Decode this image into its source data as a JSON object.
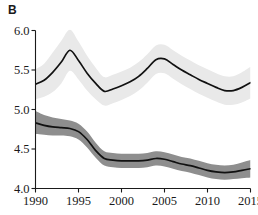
{
  "panel": {
    "label": "B"
  },
  "chart_data": {
    "type": "line",
    "title": "",
    "subtitle": "",
    "xlabel": "",
    "ylabel": "",
    "xlim": [
      1990,
      2015
    ],
    "ylim": [
      4.0,
      6.0
    ],
    "grid": false,
    "legend": null,
    "xticks": [
      "1990",
      "1995",
      "2000",
      "2005",
      "2010",
      "2015"
    ],
    "xtick_values": [
      1990,
      1995,
      2000,
      2005,
      2010,
      2015
    ],
    "yticks": [
      "4.0",
      "4.5",
      "5.0",
      "5.5",
      "6.0"
    ],
    "ytick_values": [
      4.0,
      4.5,
      5.0,
      5.5,
      6.0
    ],
    "x": [
      1990,
      1991,
      1992,
      1993,
      1994,
      1995,
      1996,
      1997,
      1998,
      1999,
      2000,
      2001,
      2002,
      2003,
      2004,
      2005,
      2006,
      2007,
      2008,
      2009,
      2010,
      2011,
      2012,
      2013,
      2014,
      2015
    ],
    "series": [
      {
        "name": "upper-series",
        "color": "#111111",
        "band_color": "#e9e9e9",
        "values": [
          5.32,
          5.37,
          5.47,
          5.6,
          5.75,
          5.62,
          5.46,
          5.33,
          5.23,
          5.26,
          5.3,
          5.35,
          5.42,
          5.52,
          5.63,
          5.64,
          5.57,
          5.5,
          5.44,
          5.38,
          5.33,
          5.28,
          5.24,
          5.24,
          5.28,
          5.34
        ],
        "band_lower": [
          5.13,
          5.16,
          5.22,
          5.33,
          5.49,
          5.38,
          5.24,
          5.13,
          5.05,
          5.08,
          5.12,
          5.17,
          5.24,
          5.34,
          5.45,
          5.46,
          5.39,
          5.32,
          5.26,
          5.2,
          5.15,
          5.1,
          5.06,
          5.06,
          5.09,
          5.14
        ],
        "band_upper": [
          5.51,
          5.58,
          5.72,
          5.87,
          6.01,
          5.86,
          5.68,
          5.53,
          5.41,
          5.44,
          5.48,
          5.53,
          5.6,
          5.7,
          5.81,
          5.82,
          5.75,
          5.68,
          5.62,
          5.56,
          5.51,
          5.46,
          5.42,
          5.42,
          5.47,
          5.54
        ]
      },
      {
        "name": "lower-series",
        "color": "#111111",
        "band_color": "#8e8e8e",
        "values": [
          4.83,
          4.8,
          4.78,
          4.77,
          4.76,
          4.72,
          4.62,
          4.48,
          4.38,
          4.36,
          4.35,
          4.35,
          4.35,
          4.36,
          4.38,
          4.37,
          4.34,
          4.31,
          4.29,
          4.26,
          4.23,
          4.21,
          4.2,
          4.21,
          4.23,
          4.25
        ],
        "band_lower": [
          4.69,
          4.68,
          4.67,
          4.67,
          4.66,
          4.62,
          4.52,
          4.39,
          4.29,
          4.27,
          4.26,
          4.26,
          4.26,
          4.27,
          4.29,
          4.28,
          4.25,
          4.22,
          4.2,
          4.17,
          4.14,
          4.12,
          4.11,
          4.12,
          4.13,
          4.14
        ],
        "band_upper": [
          4.98,
          4.93,
          4.9,
          4.88,
          4.86,
          4.82,
          4.72,
          4.58,
          4.47,
          4.45,
          4.44,
          4.44,
          4.44,
          4.45,
          4.47,
          4.46,
          4.43,
          4.4,
          4.38,
          4.35,
          4.32,
          4.3,
          4.29,
          4.3,
          4.33,
          4.36
        ]
      }
    ]
  },
  "axes": {
    "axis_color": "#1a1a1a"
  }
}
